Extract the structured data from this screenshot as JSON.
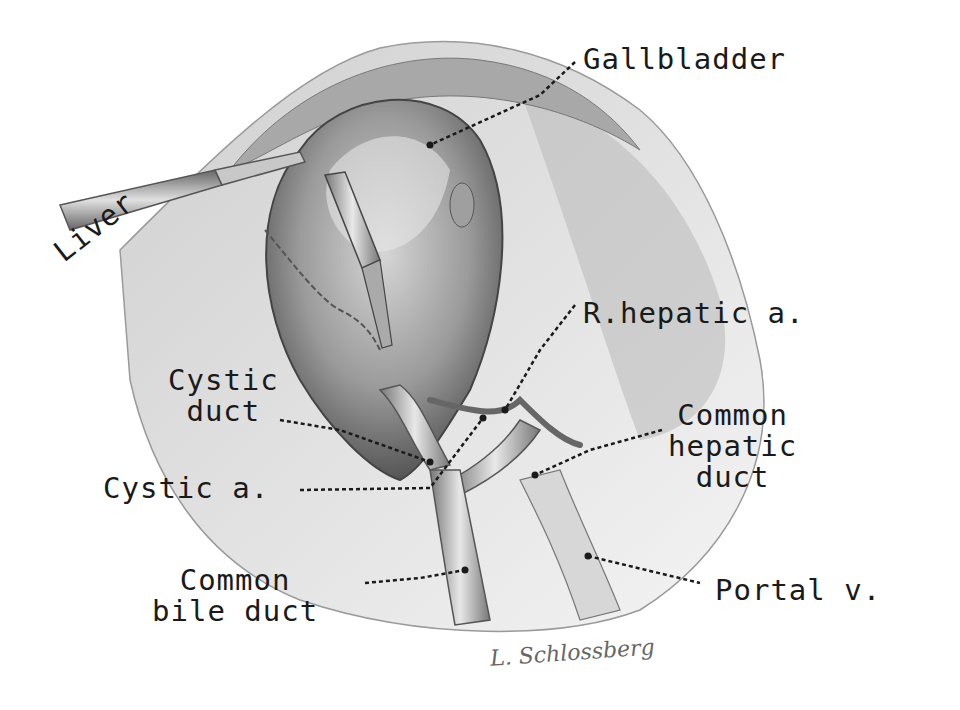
{
  "figure": {
    "ink_color": "#1a1a1a",
    "background_color": "#ffffff",
    "labels": [
      {
        "id": "gallbladder",
        "text": "Gallbladder"
      },
      {
        "id": "liver",
        "text": "Liver"
      },
      {
        "id": "r-hepatic-a",
        "text": "R.hepatic a."
      },
      {
        "id": "cystic-duct",
        "text": "Cystic\nduct"
      },
      {
        "id": "common-hepatic-duct",
        "text": "Common\nhepatic\nduct"
      },
      {
        "id": "cystic-a",
        "text": "Cystic a."
      },
      {
        "id": "common-bile-duct",
        "text": "Common\nbile duct"
      },
      {
        "id": "portal-v",
        "text": "Portal v."
      }
    ],
    "signature": "L. Schlossberg"
  }
}
